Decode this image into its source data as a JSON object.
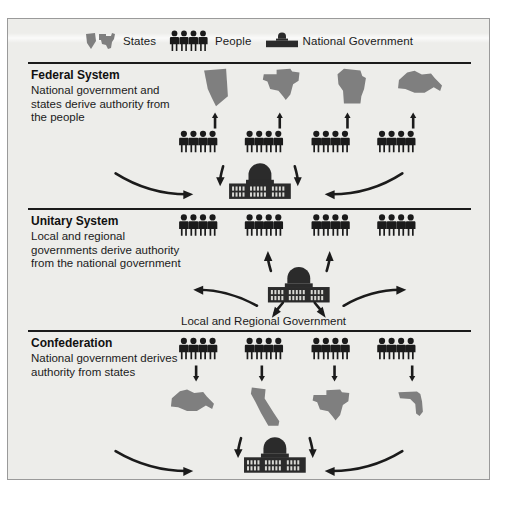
{
  "figure": {
    "background": "#ededea",
    "frame_border": "#9a9a9a",
    "ink": "#1b1b1b",
    "state_color": "#7f7f7f",
    "icon_color": "#1b1b1b"
  },
  "legend": {
    "items": [
      {
        "icon": "states-icon",
        "label": "States"
      },
      {
        "icon": "people-icon",
        "label": "People"
      },
      {
        "icon": "national-government-icon",
        "label": "National Government"
      }
    ]
  },
  "sections": [
    {
      "id": "federal-system",
      "title": "Federal System",
      "description": "National government and states derive authority from the people",
      "states": [
        "Nevada",
        "Texas",
        "Minnesota",
        "New York"
      ],
      "people_groups": 4,
      "people_per_group": 4,
      "flow": "people-up-to-states, people-in-to-national-government",
      "arrow_direction": "up",
      "has_national_government": true,
      "center_label": ""
    },
    {
      "id": "unitary-system",
      "title": "Unitary System",
      "description": "Local and regional governments derive authority from the national government",
      "states": [],
      "people_groups": 4,
      "people_per_group": 4,
      "flow": "national-government-out-to-people-and-local-regional",
      "arrow_direction": "out",
      "has_national_government": true,
      "center_label": "Local and Regional Government"
    },
    {
      "id": "confederation",
      "title": "Confederation",
      "description": "National government derives authority from states",
      "states": [
        "New York",
        "California",
        "Texas",
        "Florida"
      ],
      "people_groups": 4,
      "people_per_group": 4,
      "flow": "people-down-to-states, states-in-to-national-government",
      "arrow_direction": "down",
      "has_national_government": true,
      "center_label": ""
    }
  ]
}
